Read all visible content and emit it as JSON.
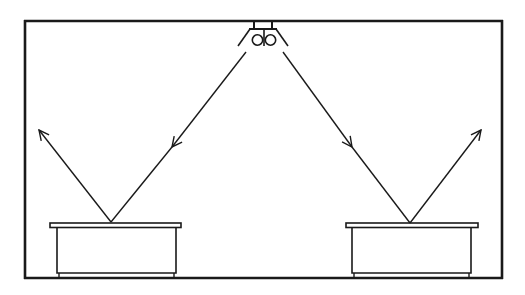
{
  "diagram": {
    "type": "light-reflection-illustration",
    "colors": {
      "line": "#1a1a1a",
      "background": "#ffffff"
    },
    "room": {
      "left": 25,
      "top": 21,
      "right": 502,
      "bottom": 278
    },
    "lamp": {
      "cx": 264,
      "circles": [
        {
          "cx": 258,
          "cy": 40,
          "r": 5
        },
        {
          "cx": 271,
          "cy": 40,
          "r": 5
        }
      ]
    },
    "boxes": [
      {
        "id": "left-box",
        "lid": [
          50,
          223,
          181,
          228
        ],
        "body": [
          57,
          228,
          176,
          273
        ]
      },
      {
        "id": "right-box",
        "lid": [
          346,
          223,
          478,
          228
        ],
        "body": [
          352,
          228,
          471,
          273
        ]
      }
    ],
    "rays": [
      {
        "id": "incident-left",
        "from": [
          246,
          52
        ],
        "to": [
          111,
          222
        ],
        "arrow_at": [
          172,
          146
        ]
      },
      {
        "id": "reflected-left",
        "from": [
          111,
          222
        ],
        "to": [
          39,
          130
        ]
      },
      {
        "id": "incident-right",
        "from": [
          283,
          52
        ],
        "to": [
          410,
          223
        ],
        "arrow_at": [
          352,
          146
        ]
      },
      {
        "id": "reflected-right",
        "from": [
          410,
          223
        ],
        "to": [
          481,
          130
        ]
      }
    ]
  }
}
